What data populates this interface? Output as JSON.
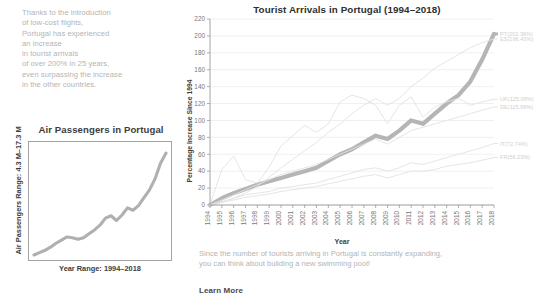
{
  "intro": {
    "lines": [
      "Thanks to the introduction",
      "of low-cost flights,",
      "Portugal has experienced",
      "an increase",
      "in tourist arrivals",
      "of over 200% in 25 years,",
      "even surpassing the increase",
      "in the other countries."
    ]
  },
  "outro": {
    "lines": [
      "Since the number of tourists arriving in Portugal is constantly expanding,",
      "you can think about building a new swimming pool!"
    ],
    "learn_more_label": "Learn More"
  },
  "mini_chart": {
    "title": "Air Passengers in Portugal",
    "ylabel": "Air Passengers Range: 4.3 M–17.3 M",
    "xlabel": "Year Range: 1994–2018",
    "line_color": "#b0b0b0",
    "chart_data": {
      "type": "line",
      "title": "Air Passengers in Portugal",
      "xlabel": "Year Range: 1994–2018",
      "ylabel": "Air Passengers Range: 4.3 M–17.3 M",
      "grid": false,
      "legend": "none",
      "xlim": [
        1994,
        2018
      ],
      "ylim": [
        4.3,
        17.3
      ],
      "x": [
        1994,
        1995,
        1996,
        1997,
        1998,
        1999,
        2000,
        2001,
        2002,
        2003,
        2004,
        2005,
        2006,
        2007,
        2008,
        2009,
        2010,
        2011,
        2012,
        2013,
        2014,
        2015,
        2016,
        2017,
        2018
      ],
      "values": [
        4.3,
        4.6,
        4.9,
        5.3,
        5.8,
        6.2,
        6.6,
        6.5,
        6.3,
        6.5,
        7.0,
        7.5,
        8.1,
        9.0,
        9.3,
        8.7,
        9.4,
        10.3,
        10.0,
        10.6,
        11.6,
        12.6,
        14.0,
        16.0,
        17.3
      ]
    }
  },
  "main_chart": {
    "title": "Tourist Arrivals in Portugal (1994–2018)",
    "ylabel": "Percentage Increase Since 1994",
    "xlabel": "Year",
    "ylim": [
      0,
      220
    ],
    "ytick_step": 20,
    "yticks": [
      0,
      20,
      40,
      60,
      80,
      100,
      120,
      140,
      160,
      180,
      200,
      220
    ],
    "xticks": [
      "1994",
      "1995",
      "1996",
      "1997",
      "1998",
      "1999",
      "2000",
      "2001",
      "2002",
      "2003",
      "2004",
      "2005",
      "2006",
      "2007",
      "2008",
      "2009",
      "2010",
      "2011",
      "2012",
      "2013",
      "2014",
      "2015",
      "2016",
      "2017",
      "2018"
    ],
    "highlight_color": "#b5b5b5",
    "other_color": "#e2e2e2",
    "chart_data": {
      "type": "line",
      "title": "Tourist Arrivals in Portugal (1994–2018)",
      "xlabel": "Year",
      "ylabel": "Percentage Increase Since 1994",
      "ylim": [
        0,
        220
      ],
      "grid": true,
      "legend": "right",
      "x": [
        1994,
        1995,
        1996,
        1997,
        1998,
        1999,
        2000,
        2001,
        2002,
        2003,
        2004,
        2005,
        2006,
        2007,
        2008,
        2009,
        2010,
        2011,
        2012,
        2013,
        2014,
        2015,
        2016,
        2017,
        2018
      ],
      "series": [
        {
          "name": "PT",
          "label": "PT(202.36%)",
          "final_value": 202.36,
          "highlight": true,
          "values": [
            0,
            8,
            14,
            19,
            24,
            28,
            32,
            36,
            40,
            44,
            52,
            60,
            66,
            74,
            82,
            78,
            88,
            100,
            96,
            108,
            120,
            130,
            146,
            172,
            202.36
          ]
        },
        {
          "name": "ES",
          "label": "ES(196.43%)",
          "final_value": 196.43,
          "highlight": false,
          "values": [
            0,
            3,
            8,
            14,
            22,
            33,
            44,
            54,
            64,
            74,
            86,
            96,
            108,
            118,
            126,
            118,
            126,
            140,
            150,
            162,
            170,
            178,
            186,
            192,
            196.43
          ]
        },
        {
          "name": "UK",
          "label": "UK(125.08%)",
          "final_value": 125.08,
          "highlight": false,
          "values": [
            0,
            42,
            58,
            30,
            26,
            45,
            70,
            82,
            94,
            86,
            96,
            122,
            130,
            126,
            118,
            96,
            118,
            128,
            104,
            116,
            122,
            126,
            118,
            122,
            125.08
          ]
        },
        {
          "name": "DE",
          "label": "DE(115.98%)",
          "final_value": 115.98,
          "highlight": false,
          "values": [
            0,
            6,
            12,
            18,
            24,
            30,
            36,
            40,
            44,
            48,
            54,
            60,
            66,
            72,
            78,
            72,
            80,
            88,
            92,
            96,
            100,
            104,
            108,
            112,
            115.98
          ]
        },
        {
          "name": "IT",
          "label": "IT(72.74%)",
          "final_value": 72.74,
          "highlight": false,
          "values": [
            0,
            4,
            8,
            12,
            14,
            16,
            20,
            22,
            24,
            26,
            30,
            34,
            38,
            42,
            44,
            40,
            44,
            50,
            48,
            52,
            56,
            60,
            64,
            68,
            72.74
          ]
        },
        {
          "name": "FR",
          "label": "FR(56.23%)",
          "final_value": 56.23,
          "highlight": false,
          "values": [
            0,
            3,
            6,
            9,
            11,
            13,
            16,
            18,
            20,
            22,
            25,
            28,
            31,
            34,
            36,
            32,
            36,
            40,
            40,
            42,
            46,
            48,
            50,
            53,
            56.23
          ]
        }
      ]
    }
  }
}
